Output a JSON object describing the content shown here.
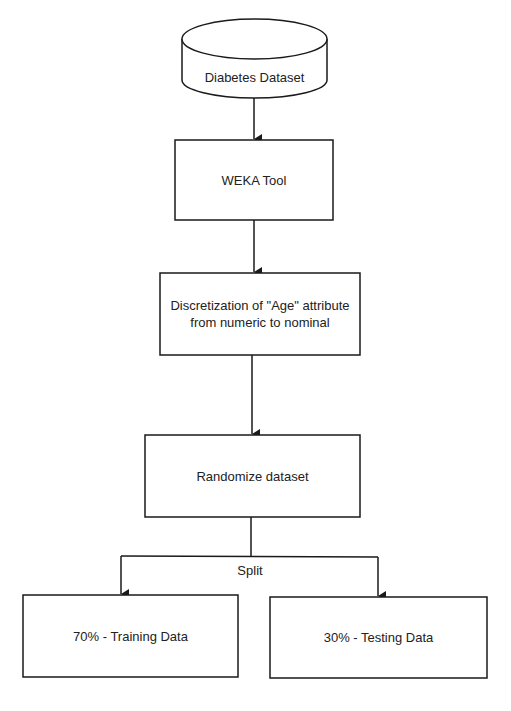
{
  "diagram": {
    "nodes": [
      {
        "id": "dataset",
        "shape": "cylinder",
        "label": "Diabetes Dataset"
      },
      {
        "id": "weka",
        "shape": "rectangle",
        "label": "WEKA Tool"
      },
      {
        "id": "discretize",
        "shape": "rectangle",
        "label": "Discretization of \"Age\" attribute from numeric to nominal"
      },
      {
        "id": "randomize",
        "shape": "rectangle",
        "label": "Randomize dataset"
      },
      {
        "id": "training",
        "shape": "rectangle",
        "label": "70% - Training Data"
      },
      {
        "id": "testing",
        "shape": "rectangle",
        "label": "30% - Testing Data"
      }
    ],
    "edges": [
      {
        "from": "dataset",
        "to": "weka"
      },
      {
        "from": "weka",
        "to": "discretize"
      },
      {
        "from": "discretize",
        "to": "randomize"
      },
      {
        "from": "randomize",
        "to": "training",
        "label": "Split"
      },
      {
        "from": "randomize",
        "to": "testing",
        "label": "Split"
      }
    ],
    "split_label": "Split",
    "colors": {
      "stroke": "#1a1a1a",
      "fill": "#ffffff",
      "text": "#222222"
    }
  }
}
